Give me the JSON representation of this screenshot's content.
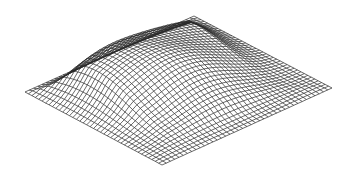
{
  "figure": {
    "type": "3d-wireframe-surface",
    "background": "#ffffff",
    "line_color": "#2a2a2a",
    "grid": {
      "rows": 40,
      "cols": 40
    },
    "corners": {
      "left": [
        25,
        92
      ],
      "top": [
        194,
        16
      ],
      "right": [
        332,
        88
      ],
      "bottom": [
        162,
        165
      ]
    },
    "surface": {
      "peak_height_px": 38,
      "peak_center_uv": [
        0.42,
        0.4
      ],
      "spread_uv": [
        0.3,
        0.26
      ],
      "ripple_amplitude_px": 3
    }
  }
}
